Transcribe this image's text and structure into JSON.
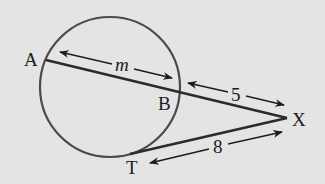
{
  "diagram": {
    "type": "circle-secant-tangent",
    "colors": {
      "background": "#e4e4e4",
      "circle_stroke": "#4a4a4a",
      "line_stroke": "#2b2b2b",
      "text": "#1c1c1c"
    },
    "circle": {
      "cx": 110,
      "cy": 87,
      "r": 70
    },
    "points": {
      "A": {
        "label": "A",
        "x": 46,
        "y": 60
      },
      "B": {
        "label": "B",
        "x": 179,
        "y": 91
      },
      "X": {
        "label": "X",
        "x": 287,
        "y": 118
      },
      "T": {
        "label": "T",
        "x": 138,
        "y": 152
      }
    },
    "segments": [
      {
        "name": "secant",
        "from": "A",
        "to": "X"
      },
      {
        "name": "tangent",
        "from": "T",
        "to": "X"
      }
    ],
    "measures": {
      "AB": {
        "label": "m"
      },
      "BX": {
        "label": "5"
      },
      "TX": {
        "label": "8"
      }
    }
  }
}
